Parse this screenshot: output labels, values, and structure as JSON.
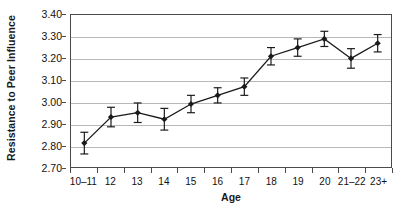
{
  "chart_data": {
    "type": "line",
    "title": "",
    "xlabel": "Age",
    "ylabel": "Resistance to Peer Influence",
    "categories": [
      "10–11",
      "12",
      "13",
      "14",
      "15",
      "16",
      "17",
      "18",
      "19",
      "20",
      "21–22",
      "23+"
    ],
    "values": [
      2.81,
      2.93,
      2.95,
      2.92,
      2.99,
      3.03,
      3.07,
      3.21,
      3.25,
      3.29,
      3.2,
      3.27
    ],
    "errors": [
      0.05,
      0.045,
      0.045,
      0.05,
      0.04,
      0.035,
      0.04,
      0.04,
      0.04,
      0.035,
      0.045,
      0.04
    ],
    "ylim": [
      2.7,
      3.4
    ],
    "ytick_labels": [
      "3.40",
      "3.30",
      "3.20",
      "3.10",
      "3.00",
      "2.90",
      "2.80",
      "2.70"
    ],
    "ytick_values": [
      3.4,
      3.3,
      3.2,
      3.1,
      3.0,
      2.9,
      2.8,
      2.7
    ],
    "grid": true,
    "legend": "none",
    "error_bar_style": "capped",
    "marker": "filled-diamond",
    "line_color": "#1a1a1a",
    "marker_color": "#1a1a1a",
    "grid_color": "#b8b8b8",
    "frame_color": "#4a4a4a",
    "background": "#ffffff"
  }
}
